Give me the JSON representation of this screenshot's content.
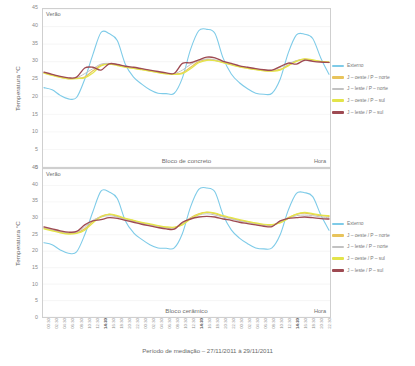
{
  "figure": {
    "caption": "Período de mediação – 27/11/2011 à 29/11/2011",
    "ylabel": "Temperatura °C",
    "xlabel": "Hora",
    "season_annotation": "Verão"
  },
  "legend": {
    "items": [
      {
        "label": "Externo",
        "color": "#7ecbe8"
      },
      {
        "label": "J – oeste / P – norte",
        "color": "#e8c45c"
      },
      {
        "label": "J – leste / P – norte",
        "color": "#c2c2c2"
      },
      {
        "label": "J – oeste / P – sul",
        "color": "#e3e44a"
      },
      {
        "label": "J – leste / P – sul",
        "color": "#9e4a52"
      }
    ]
  },
  "yticks": [
    "45",
    "40",
    "35",
    "30",
    "25",
    "20",
    "15",
    "10",
    "5",
    "0"
  ],
  "xticks": [
    "00:30",
    "02:30",
    "04:30",
    "06:30",
    "08:30",
    "10:30",
    "12:30",
    "14:30",
    "16:30",
    "18:30",
    "20:30",
    "22:30",
    "00:30",
    "02:30",
    "04:30",
    "06:30",
    "08:30",
    "10:30",
    "12:30",
    "14:30",
    "16:30",
    "18:30",
    "20:30",
    "22:30",
    "00:30",
    "02:30",
    "04:30",
    "06:30",
    "08:30",
    "10:30",
    "12:30",
    "14:30",
    "16:30",
    "18:30",
    "20:30",
    "22:30"
  ],
  "xticks_bold_indices": [
    7,
    19,
    31
  ],
  "chart_data": [
    {
      "type": "line",
      "title": "Bloco de concreto",
      "xlabel": "Hora",
      "ylabel": "Temperatura °C",
      "ylim": [
        0,
        45
      ],
      "grid": true,
      "legend_position": "right",
      "annotation": "Verão",
      "x": [
        "00:30",
        "02:30",
        "04:30",
        "06:30",
        "08:30",
        "10:30",
        "12:30",
        "14:30",
        "16:30",
        "18:30",
        "20:30",
        "22:30",
        "00:30",
        "02:30",
        "04:30",
        "06:30",
        "08:30",
        "10:30",
        "12:30",
        "14:30",
        "16:30",
        "18:30",
        "20:30",
        "22:30",
        "00:30",
        "02:30",
        "04:30",
        "06:30",
        "08:30",
        "10:30",
        "12:30",
        "14:30",
        "16:30",
        "18:30",
        "20:30",
        "22:30"
      ],
      "series": [
        {
          "name": "Externo",
          "color": "#7ecbe8",
          "values": [
            22.6,
            22.0,
            20.4,
            19.4,
            19.8,
            25.0,
            32.0,
            38.3,
            38.0,
            36.0,
            29.2,
            25.6,
            23.6,
            22.0,
            21.0,
            20.9,
            21.0,
            25.4,
            33.5,
            38.8,
            39.2,
            38.0,
            31.0,
            26.5,
            24.0,
            22.3,
            21.0,
            20.7,
            21.0,
            25.0,
            32.5,
            37.6,
            37.8,
            36.6,
            31.0,
            26.4
          ]
        },
        {
          "name": "J – oeste / P – norte",
          "color": "#e8c45c",
          "values": [
            26.8,
            26.2,
            25.6,
            25.2,
            25.3,
            25.6,
            27.4,
            29.0,
            29.4,
            29.0,
            28.5,
            28.2,
            27.8,
            27.4,
            27.0,
            26.6,
            26.5,
            26.8,
            28.4,
            30.0,
            30.6,
            30.4,
            29.8,
            29.2,
            28.6,
            28.2,
            27.8,
            27.5,
            27.4,
            27.8,
            29.0,
            30.2,
            30.7,
            30.4,
            30.0,
            29.8
          ]
        },
        {
          "name": "J – leste / P – norte",
          "color": "#c2c2c2",
          "values": [
            26.9,
            26.3,
            25.7,
            25.3,
            25.4,
            26.6,
            28.0,
            29.3,
            29.5,
            29.1,
            28.6,
            28.3,
            27.9,
            27.5,
            27.1,
            26.7,
            26.6,
            27.6,
            29.2,
            30.3,
            30.8,
            30.5,
            29.9,
            29.3,
            28.7,
            28.3,
            27.9,
            27.6,
            27.5,
            28.4,
            29.4,
            30.3,
            30.5,
            30.2,
            29.9,
            29.7
          ]
        },
        {
          "name": "J – oeste / P – sul",
          "color": "#e3e44a",
          "values": [
            26.7,
            26.1,
            25.5,
            25.1,
            25.2,
            25.4,
            26.8,
            28.8,
            29.3,
            28.9,
            28.4,
            28.1,
            27.7,
            27.3,
            26.9,
            26.5,
            26.4,
            26.6,
            28.0,
            29.7,
            30.4,
            30.3,
            29.7,
            29.1,
            28.5,
            28.1,
            27.7,
            27.4,
            27.3,
            27.6,
            28.8,
            30.1,
            30.8,
            30.5,
            30.1,
            29.9
          ]
        },
        {
          "name": "J – leste / P – sul",
          "color": "#9e4a52",
          "values": [
            27.0,
            26.4,
            25.8,
            25.4,
            25.6,
            28.2,
            28.4,
            27.6,
            29.4,
            29.2,
            28.7,
            28.4,
            28.0,
            27.6,
            27.2,
            26.8,
            26.7,
            29.5,
            29.7,
            30.5,
            31.3,
            31.1,
            30.1,
            29.5,
            28.8,
            28.4,
            28.0,
            27.7,
            27.6,
            28.6,
            29.6,
            29.3,
            30.4,
            30.1,
            29.9,
            29.8
          ]
        }
      ]
    },
    {
      "type": "line",
      "title": "Bloco cerâmico",
      "xlabel": "Hora",
      "ylabel": "Temperatura °C",
      "ylim": [
        0,
        45
      ],
      "grid": true,
      "legend_position": "right",
      "annotation": "Verão",
      "x": [
        "00:30",
        "02:30",
        "04:30",
        "06:30",
        "08:30",
        "10:30",
        "12:30",
        "14:30",
        "16:30",
        "18:30",
        "20:30",
        "22:30",
        "00:30",
        "02:30",
        "04:30",
        "06:30",
        "08:30",
        "10:30",
        "12:30",
        "14:30",
        "16:30",
        "18:30",
        "20:30",
        "22:30",
        "00:30",
        "02:30",
        "04:30",
        "06:30",
        "08:30",
        "10:30",
        "12:30",
        "14:30",
        "16:30",
        "18:30",
        "20:30",
        "22:30"
      ],
      "series": [
        {
          "name": "Externo",
          "color": "#7ecbe8",
          "values": [
            22.6,
            22.0,
            20.4,
            19.4,
            19.8,
            25.0,
            32.0,
            38.3,
            38.0,
            36.0,
            29.2,
            25.6,
            23.6,
            22.0,
            21.0,
            20.9,
            21.0,
            25.4,
            33.5,
            38.8,
            39.2,
            38.0,
            31.0,
            26.5,
            24.0,
            22.3,
            21.0,
            20.7,
            21.0,
            25.0,
            32.5,
            37.6,
            37.8,
            36.6,
            31.0,
            26.4
          ]
        },
        {
          "name": "J – oeste / P – norte",
          "color": "#e8c45c",
          "values": [
            27.0,
            26.4,
            25.8,
            25.4,
            25.6,
            26.8,
            29.0,
            30.6,
            31.2,
            30.6,
            29.8,
            29.2,
            28.6,
            28.1,
            27.6,
            27.2,
            27.1,
            28.4,
            30.2,
            31.4,
            31.8,
            31.4,
            30.6,
            30.0,
            29.4,
            28.9,
            28.4,
            28.0,
            27.9,
            28.8,
            30.2,
            31.2,
            31.6,
            31.2,
            30.8,
            30.6
          ]
        },
        {
          "name": "J – leste / P – norte",
          "color": "#c2c2c2",
          "values": [
            27.2,
            26.6,
            26.0,
            25.6,
            25.8,
            27.4,
            29.4,
            30.4,
            30.8,
            30.4,
            29.6,
            29.0,
            28.4,
            27.9,
            27.4,
            27.0,
            26.9,
            28.6,
            30.0,
            31.0,
            31.4,
            31.0,
            30.4,
            29.8,
            29.2,
            28.7,
            28.2,
            27.8,
            27.7,
            29.0,
            30.0,
            30.8,
            31.0,
            30.8,
            30.4,
            30.2
          ]
        },
        {
          "name": "J – oeste / P – sul",
          "color": "#e3e44a",
          "values": [
            26.8,
            26.2,
            25.6,
            25.2,
            25.4,
            26.4,
            28.6,
            30.4,
            31.3,
            30.8,
            30.0,
            29.4,
            28.8,
            28.3,
            27.8,
            27.4,
            27.3,
            28.0,
            29.8,
            31.2,
            31.9,
            31.6,
            30.8,
            30.2,
            29.6,
            29.1,
            28.6,
            28.2,
            28.1,
            28.6,
            30.0,
            31.3,
            31.8,
            31.4,
            31.0,
            30.8
          ]
        },
        {
          "name": "J – leste / P – sul",
          "color": "#9e4a52",
          "values": [
            27.4,
            26.8,
            26.2,
            25.8,
            26.0,
            28.0,
            29.2,
            29.6,
            30.2,
            30.0,
            29.4,
            28.8,
            28.2,
            27.7,
            27.2,
            26.8,
            26.7,
            28.8,
            29.8,
            30.4,
            30.6,
            30.4,
            29.8,
            29.4,
            28.8,
            28.4,
            28.0,
            27.6,
            27.5,
            29.2,
            30.0,
            30.2,
            30.4,
            30.2,
            29.9,
            29.8
          ]
        }
      ]
    }
  ]
}
